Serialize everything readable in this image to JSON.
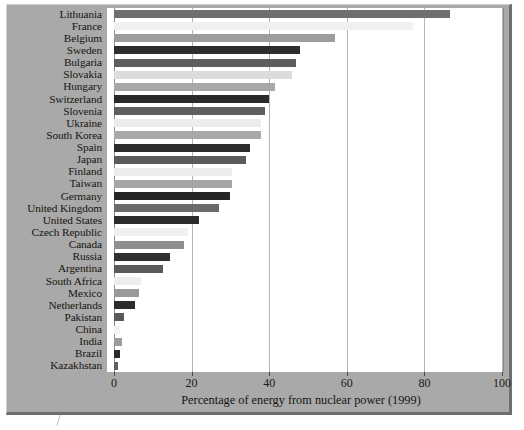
{
  "figure": {
    "axis_title": "Percentage of energy from nuclear power (1999)"
  },
  "chart_data": {
    "type": "bar",
    "orientation": "horizontal",
    "title": "",
    "xlabel": "Percentage of energy from nuclear power (1999)",
    "ylabel": "",
    "xlim": [
      0,
      100
    ],
    "xticks": [
      0,
      20,
      40,
      60,
      80,
      100
    ],
    "grid": true,
    "legend": "none",
    "categories": [
      "Lithuania",
      "France",
      "Belgium",
      "Sweden",
      "Bulgaria",
      "Slovakia",
      "Hungary",
      "Switzerland",
      "Slovenia",
      "Ukraine",
      "South Korea",
      "Spain",
      "Japan",
      "Finland",
      "Taiwan",
      "Germany",
      "United Kingdom",
      "United States",
      "Czech Republic",
      "Canada",
      "Russia",
      "Argentina",
      "South Africa",
      "Mexico",
      "Netherlands",
      "Pakistan",
      "China",
      "India",
      "Brazil",
      "Kazakhstan"
    ],
    "values": [
      86.6,
      77.0,
      57.0,
      48.0,
      47.0,
      46.0,
      41.5,
      40.0,
      39.0,
      38.0,
      38.0,
      35.0,
      34.0,
      30.5,
      30.5,
      30.0,
      27.0,
      22.0,
      19.0,
      18.0,
      14.5,
      12.5,
      7.0,
      6.5,
      5.5,
      2.5,
      1.5,
      2.0,
      1.5,
      1.0
    ],
    "bar_colors": [
      "#6f6f6f",
      "#f0f0f0",
      "#9d9d9d",
      "#2e2e2e",
      "#5e5e5e",
      "#dcdcdc",
      "#a8a8a8",
      "#2a2a2a",
      "#5f5f5f",
      "#ededed",
      "#a8a8a8",
      "#2b2b2b",
      "#5b5b5b",
      "#ececec",
      "#a6a6a6",
      "#252525",
      "#6b6b6b",
      "#2b2b2b",
      "#f0f0f0",
      "#8f8f8f",
      "#2f2f2f",
      "#5b5b5b",
      "#ededed",
      "#9a9a9a",
      "#2c2c2c",
      "#5a5a5a",
      "#f2f2f2",
      "#9d9d9d",
      "#2b2b2b",
      "#5f5f5f"
    ]
  },
  "colors": {
    "frame_background": "#a9a9a9",
    "plot_background": "#ffffff",
    "gridline": "#b4b4b4",
    "text": "#17150f"
  }
}
